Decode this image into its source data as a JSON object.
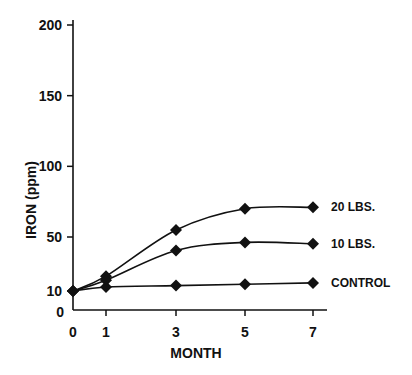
{
  "chart_data": {
    "type": "line",
    "title": "",
    "xlabel": "MONTH",
    "ylabel": "IRON (ppm)",
    "x": [
      0,
      1,
      3,
      5,
      7
    ],
    "x_ticks": [
      "0",
      "1",
      "3",
      "5",
      "7"
    ],
    "y_ticks": [
      "0",
      "10",
      "50",
      "100",
      "150",
      "200"
    ],
    "ylim": [
      0,
      200
    ],
    "grid": false,
    "legend_position": "inline-right",
    "series": [
      {
        "name": "20 LBS.",
        "values": [
          10,
          21,
          55,
          70,
          71
        ]
      },
      {
        "name": "10 LBS.",
        "values": [
          10,
          18,
          40,
          46,
          45
        ]
      },
      {
        "name": "CONTROL",
        "values": [
          10,
          13,
          14,
          15,
          16
        ]
      }
    ],
    "marker": "diamond",
    "line_color": "#111111"
  }
}
